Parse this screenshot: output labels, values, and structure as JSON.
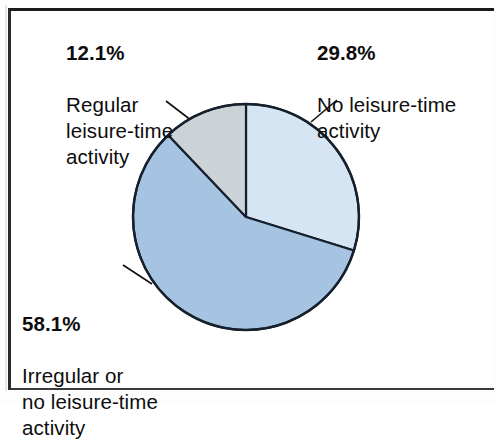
{
  "figure": {
    "background_color": "#ffffff",
    "frame_color": "#1a1a1a"
  },
  "chart_data": {
    "type": "pie",
    "title": "",
    "subtitle": "",
    "xlabel": "",
    "ylabel": "",
    "legend_position": "callout-labels",
    "grid": false,
    "units": "percent",
    "start_angle_deg": 0,
    "direction": "clockwise",
    "categories": [
      "No leisure-time activity",
      "Irregular or no leisure-time activity",
      "Regular leisure-time activity"
    ],
    "values": [
      29.8,
      58.1,
      12.1
    ],
    "labels": [
      "29.8%",
      "58.1%",
      "12.1%"
    ],
    "colors": [
      "#d5e5f3",
      "#a6c3e2",
      "#ccd3d7"
    ],
    "slices": [
      {
        "name": "no-leisure-time-activity",
        "percent": 29.8,
        "percent_label": "29.8%",
        "description": "No leisure-time activity",
        "color": "#d5e5f3",
        "start_angle_deg": 0,
        "end_angle_deg": 107.3
      },
      {
        "name": "irregular-or-no-leisure-time-activity",
        "percent": 58.1,
        "percent_label": "58.1%",
        "description": "Irregular or\nno leisure-time\nactivity",
        "color": "#a6c3e2",
        "start_angle_deg": 107.3,
        "end_angle_deg": 316.4
      },
      {
        "name": "regular-leisure-time-activity",
        "percent": 12.1,
        "percent_label": "12.1%",
        "description": "Regular\nleisure-time\nactivity",
        "color": "#ccd3d7",
        "start_angle_deg": 316.4,
        "end_angle_deg": 360
      }
    ]
  },
  "callouts": {
    "regular": {
      "percent": "12.1%",
      "description": "Regular\nleisure-time\nactivity"
    },
    "none": {
      "percent": "29.8%",
      "description": "No leisure-time\nactivity"
    },
    "irregular": {
      "percent": "58.1%",
      "description": "Irregular or\nno leisure-time\nactivity"
    }
  }
}
